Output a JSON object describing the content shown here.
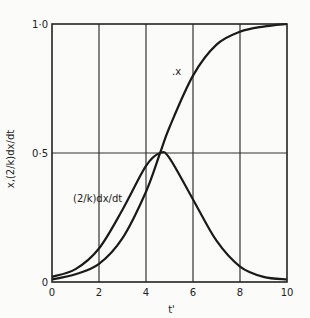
{
  "chart_data": {
    "type": "line",
    "title": "",
    "xlabel": "t'",
    "ylabel": "x,(2/k)dx/dt",
    "xlim": [
      0,
      10
    ],
    "ylim": [
      0,
      1.0
    ],
    "xticks": [
      0,
      2,
      4,
      6,
      8,
      10
    ],
    "xtick_labels": [
      "0",
      "2",
      "4",
      "6",
      "8",
      "10"
    ],
    "yticks": [
      0,
      0.5,
      1.0
    ],
    "ytick_labels": [
      "0",
      "0·5",
      "1·0"
    ],
    "grid": true,
    "series": [
      {
        "name": "x",
        "label": ".x",
        "x": [
          0,
          1,
          2,
          3,
          4,
          4.6,
          5,
          6,
          7,
          8,
          9,
          10
        ],
        "y": [
          0.01,
          0.03,
          0.07,
          0.17,
          0.35,
          0.5,
          0.6,
          0.8,
          0.92,
          0.97,
          0.99,
          1.0
        ]
      },
      {
        "name": "(2/k)dx/dt",
        "label": "(2/k)dx/dt",
        "x": [
          0,
          1,
          2,
          3,
          4,
          4.6,
          5,
          6,
          7,
          8,
          9,
          10
        ],
        "y": [
          0.02,
          0.05,
          0.13,
          0.28,
          0.45,
          0.5,
          0.48,
          0.32,
          0.16,
          0.06,
          0.02,
          0.01
        ]
      }
    ]
  }
}
